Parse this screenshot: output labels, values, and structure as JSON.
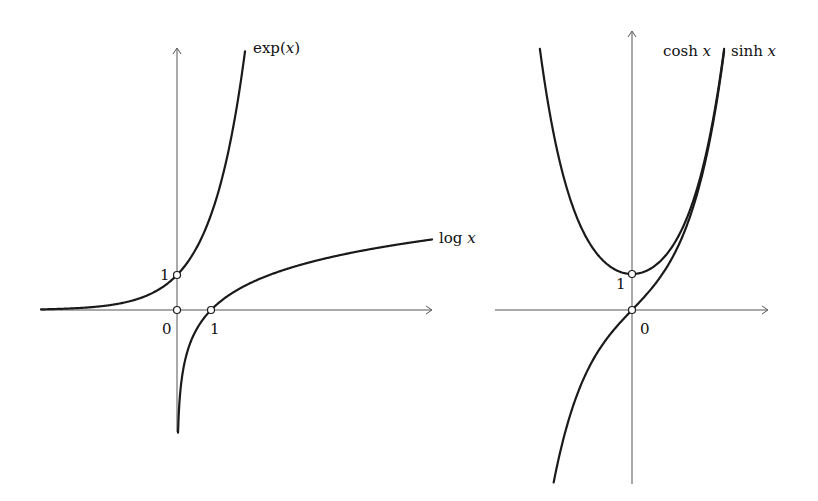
{
  "figure": {
    "left_panel": {
      "title": "Exponential and logarithm",
      "curves": [
        {
          "name": "exp",
          "label_fn": "exp(",
          "label_var": "x",
          "label_close": ")"
        },
        {
          "name": "log",
          "label_fn": "log ",
          "label_var": "x"
        }
      ],
      "tick_labels": {
        "origin": "0",
        "x_one": "1",
        "y_one": "1"
      },
      "marked_points": [
        [
          0,
          1
        ],
        [
          0,
          0
        ],
        [
          1,
          0
        ]
      ]
    },
    "right_panel": {
      "title": "Hyperbolic functions",
      "curves": [
        {
          "name": "cosh",
          "label_fn": "cosh ",
          "label_var": "x"
        },
        {
          "name": "sinh",
          "label_fn": "sinh ",
          "label_var": "x"
        }
      ],
      "tick_labels": {
        "origin": "0",
        "y_one": "1"
      },
      "marked_points": [
        [
          0,
          1
        ],
        [
          0,
          0
        ]
      ]
    },
    "colors": {
      "curve": "#1a1a1a",
      "axis": "#555555",
      "background": "#ffffff"
    }
  },
  "chart_data": [
    {
      "type": "line",
      "title": "",
      "series": [
        {
          "name": "exp(x)",
          "x": [
            -4,
            -3,
            -2,
            -1,
            0,
            0.5,
            1,
            1.5,
            2
          ],
          "y": [
            0.018,
            0.05,
            0.135,
            0.368,
            1,
            1.649,
            2.718,
            4.482,
            7.389
          ]
        },
        {
          "name": "log x",
          "x": [
            0.03,
            0.1,
            0.25,
            0.5,
            1,
            2,
            3,
            4,
            5,
            6,
            7.5
          ],
          "y": [
            -3.5,
            -2.303,
            -1.386,
            -0.693,
            0,
            0.693,
            1.099,
            1.386,
            1.609,
            1.792,
            2.015
          ]
        }
      ],
      "marked_points": [
        [
          0,
          1
        ],
        [
          0,
          0
        ],
        [
          1,
          0
        ]
      ],
      "tick_labels": {
        "x": [
          "0",
          "1"
        ],
        "y": [
          "1"
        ]
      },
      "xlim": [
        -4,
        7.5
      ],
      "ylim": [
        -3.5,
        7.5
      ],
      "grid": false,
      "legend": "inline labels at curve ends"
    },
    {
      "type": "line",
      "title": "",
      "series": [
        {
          "name": "cosh x",
          "x": [
            -2.67,
            -2,
            -1,
            0,
            1,
            2,
            2.67
          ],
          "y": [
            7.24,
            3.762,
            1.543,
            1,
            1.543,
            3.762,
            7.24
          ]
        },
        {
          "name": "sinh x",
          "x": [
            -2.27,
            -2,
            -1,
            0,
            1,
            2,
            2.67
          ],
          "y": [
            -4.78,
            -3.627,
            -1.175,
            0,
            1.175,
            3.627,
            7.17
          ]
        }
      ],
      "marked_points": [
        [
          0,
          1
        ],
        [
          0,
          0
        ]
      ],
      "tick_labels": {
        "x": [
          "0"
        ],
        "y": [
          "1"
        ]
      },
      "xlim": [
        -3.9,
        3.9
      ],
      "ylim": [
        -4.8,
        7.8
      ],
      "grid": false,
      "legend": "inline labels at curve ends"
    }
  ]
}
